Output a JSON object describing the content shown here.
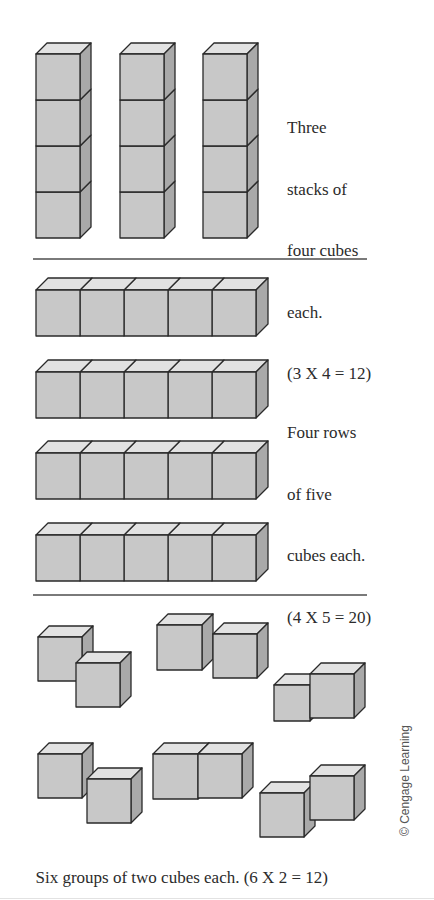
{
  "colors": {
    "front": "#c8c8c8",
    "top": "#e2e2e2",
    "side": "#a9a9a9",
    "stroke": "#2a2a2a",
    "divider": "#7a7a7a"
  },
  "sections": [
    {
      "id": "stacks",
      "caption_lines": [
        "Three",
        "stacks of",
        "four cubes",
        "each.",
        "(3 X 4 = 12)"
      ],
      "caption": "Three stacks of four cubes each. (3 X 4 = 12)",
      "equation": "3 X 4 = 12",
      "groups": 3,
      "per_group": 4,
      "total": 12
    },
    {
      "id": "rows",
      "caption_lines": [
        "Four rows",
        "of five",
        "cubes each.",
        "(4 X 5 = 20)"
      ],
      "caption": "Four rows of five cubes each. (4 X 5 = 20)",
      "equation": "4 X 5 = 20",
      "groups": 4,
      "per_group": 5,
      "total": 20
    },
    {
      "id": "groups",
      "caption_lines": [
        "Six groups of two cubes each. (6 X 2 = 12)"
      ],
      "caption": "Six groups of two cubes each. (6 X 2 = 12)",
      "equation": "6 X 2 = 12",
      "groups": 6,
      "per_group": 2,
      "total": 12
    }
  ],
  "credit": "© Cengage Learning",
  "geometry": {
    "stacks": [
      {
        "x": 36,
        "y": 54,
        "w": 44,
        "h": 46,
        "dx": 11,
        "dy": 11,
        "count": 4
      },
      {
        "x": 120,
        "y": 54,
        "w": 44,
        "h": 46,
        "dx": 11,
        "dy": 11,
        "count": 4
      },
      {
        "x": 203,
        "y": 54,
        "w": 44,
        "h": 46,
        "dx": 11,
        "dy": 11,
        "count": 4
      }
    ],
    "rows": [
      {
        "x": 36,
        "y": 290,
        "w": 44,
        "h": 46,
        "dx": 12,
        "dy": 12,
        "count": 5
      },
      {
        "x": 36,
        "y": 372,
        "w": 44,
        "h": 46,
        "dx": 12,
        "dy": 12,
        "count": 5
      },
      {
        "x": 36,
        "y": 453,
        "w": 44,
        "h": 46,
        "dx": 12,
        "dy": 12,
        "count": 5
      },
      {
        "x": 36,
        "y": 535,
        "w": 44,
        "h": 46,
        "dx": 12,
        "dy": 12,
        "count": 5
      }
    ],
    "pairs": [
      [
        {
          "x": 38,
          "y": 637,
          "s": 44
        },
        {
          "x": 76,
          "y": 663,
          "s": 44
        }
      ],
      [
        {
          "x": 157,
          "y": 625,
          "s": 45
        },
        {
          "x": 213,
          "y": 634,
          "s": 44
        }
      ],
      [
        {
          "x": 274,
          "y": 685,
          "s": 36
        },
        {
          "x": 310,
          "y": 674,
          "s": 44
        }
      ],
      [
        {
          "x": 38,
          "y": 754,
          "s": 44
        },
        {
          "x": 87,
          "y": 779,
          "s": 44
        }
      ],
      [
        {
          "x": 153,
          "y": 754,
          "s": 45
        },
        {
          "x": 198,
          "y": 754,
          "s": 44
        }
      ],
      [
        {
          "x": 260,
          "y": 793,
          "s": 44
        },
        {
          "x": 310,
          "y": 776,
          "s": 44
        }
      ]
    ],
    "cube_depth": 11
  }
}
